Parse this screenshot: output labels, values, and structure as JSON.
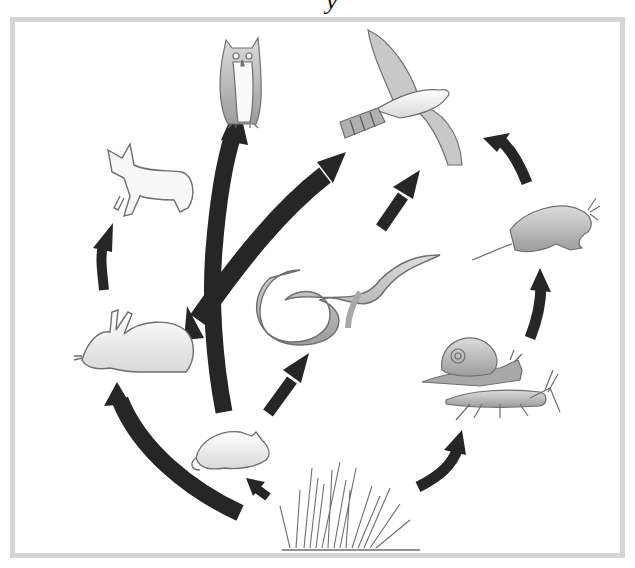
{
  "title_fragment": "y",
  "diagram": {
    "type": "food-web",
    "colors": {
      "arrow": "#262626",
      "frame": "#d6d6d6",
      "outline": "#6e6e6e",
      "fill_light": "#f2f2f2",
      "fill_mid": "#bdbdbd",
      "fill_dark": "#8a8a8a"
    },
    "organisms": [
      {
        "id": "owl",
        "label": "Owl"
      },
      {
        "id": "hawk",
        "label": "Hawk"
      },
      {
        "id": "fox",
        "label": "Fox"
      },
      {
        "id": "shrew",
        "label": "Shrew"
      },
      {
        "id": "snake",
        "label": "Snake"
      },
      {
        "id": "rabbit",
        "label": "Rabbit"
      },
      {
        "id": "snail",
        "label": "Snail"
      },
      {
        "id": "grasshopper",
        "label": "Grasshopper"
      },
      {
        "id": "mouse",
        "label": "Mouse"
      },
      {
        "id": "grass",
        "label": "Grass"
      }
    ],
    "edges": [
      {
        "from": "grass",
        "to": "rabbit"
      },
      {
        "from": "grass",
        "to": "mouse"
      },
      {
        "from": "grass",
        "to": "snail-grasshopper"
      },
      {
        "from": "rabbit",
        "to": "fox"
      },
      {
        "from": "rabbit",
        "to": "hawk"
      },
      {
        "from": "mouse",
        "to": "owl"
      },
      {
        "from": "mouse",
        "to": "snake"
      },
      {
        "from": "snake",
        "to": "hawk"
      },
      {
        "from": "snail-grasshopper",
        "to": "shrew"
      },
      {
        "from": "shrew",
        "to": "hawk"
      }
    ]
  }
}
